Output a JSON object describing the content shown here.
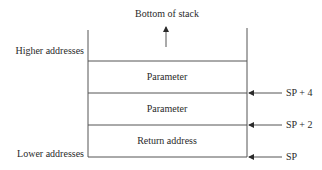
{
  "diagram": {
    "top_label": "Bottom of stack",
    "left_labels": {
      "higher": "Higher addresses",
      "lower": "Lower addresses"
    },
    "cells": [
      {
        "label": "Parameter"
      },
      {
        "label": "Parameter"
      },
      {
        "label": "Return address"
      }
    ],
    "pointers": [
      {
        "label": "SP + 4"
      },
      {
        "label": "SP + 2"
      },
      {
        "label": "SP"
      }
    ],
    "colors": {
      "line": "#555555",
      "text": "#2a2a2a"
    }
  }
}
